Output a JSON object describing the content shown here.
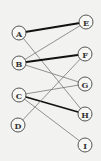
{
  "diagram": {
    "type": "bipartite-graph",
    "left_nodes": [
      {
        "id": "A",
        "label": "A",
        "x": 19,
        "y": 33
      },
      {
        "id": "B",
        "label": "B",
        "x": 19,
        "y": 63
      },
      {
        "id": "C",
        "label": "C",
        "x": 19,
        "y": 95
      },
      {
        "id": "D",
        "label": "D",
        "x": 18,
        "y": 125
      }
    ],
    "right_nodes": [
      {
        "id": "E",
        "label": "E",
        "x": 86,
        "y": 22
      },
      {
        "id": "F",
        "label": "F",
        "x": 85,
        "y": 54
      },
      {
        "id": "G",
        "label": "G",
        "x": 85,
        "y": 84
      },
      {
        "id": "H",
        "label": "H",
        "x": 85,
        "y": 114
      },
      {
        "id": "I",
        "label": "I",
        "x": 85,
        "y": 145
      }
    ],
    "edges": [
      {
        "from": "A",
        "to": "E",
        "weight": "thick"
      },
      {
        "from": "A",
        "to": "H",
        "weight": "thin"
      },
      {
        "from": "B",
        "to": "E",
        "weight": "thin"
      },
      {
        "from": "B",
        "to": "F",
        "weight": "thick"
      },
      {
        "from": "B",
        "to": "G",
        "weight": "thin"
      },
      {
        "from": "C",
        "to": "G",
        "weight": "thin"
      },
      {
        "from": "C",
        "to": "H",
        "weight": "thick"
      },
      {
        "from": "C",
        "to": "I",
        "weight": "thin"
      },
      {
        "from": "D",
        "to": "F",
        "weight": "thin"
      }
    ],
    "node_radius": 7,
    "colors": {
      "background": "#f2f2f0",
      "node_stroke": "#555555",
      "thin_edge": "#777777",
      "thick_edge": "#111111"
    }
  }
}
